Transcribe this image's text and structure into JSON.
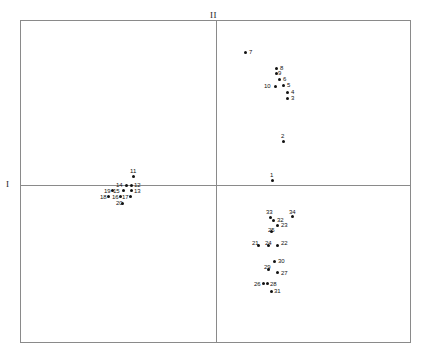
{
  "figure": {
    "type": "scatter",
    "background": "#ffffff",
    "frame_color": "#8a8a8a",
    "point_color": "#111111"
  },
  "axes": {
    "vertical_label": "II",
    "horizontal_label": "I"
  },
  "chart_data": {
    "type": "scatter",
    "title": "",
    "xlabel": "I",
    "ylabel": "II",
    "grid": false,
    "legend": null,
    "axis_style": "crossed-axes-at-origin",
    "origin_px": {
      "x": 216,
      "y": 185
    },
    "frame_px": {
      "left": 20,
      "top": 20,
      "right": 411,
      "bottom": 343
    },
    "note": "Principal coordinate / correspondence analysis style plot; 34 labelled observations.",
    "points": [
      {
        "label": "1",
        "x": 272,
        "y": 180,
        "lx": 270,
        "ly": 172,
        "lpos": "above"
      },
      {
        "label": "2",
        "x": 283,
        "y": 141,
        "lx": 281,
        "ly": 133,
        "lpos": "above"
      },
      {
        "label": "3",
        "x": 287,
        "y": 98,
        "lx": 291,
        "ly": 95,
        "lpos": "right"
      },
      {
        "label": "4",
        "x": 287,
        "y": 92,
        "lx": 291,
        "ly": 89,
        "lpos": "right"
      },
      {
        "label": "5",
        "x": 283,
        "y": 85,
        "lx": 287,
        "ly": 82,
        "lpos": "right"
      },
      {
        "label": "6",
        "x": 279,
        "y": 79,
        "lx": 283,
        "ly": 76,
        "lpos": "right"
      },
      {
        "label": "7",
        "x": 245,
        "y": 52,
        "lx": 249,
        "ly": 49,
        "lpos": "right"
      },
      {
        "label": "8",
        "x": 276,
        "y": 68,
        "lx": 280,
        "ly": 65,
        "lpos": "right"
      },
      {
        "label": "9",
        "x": 276,
        "y": 73,
        "lx": 278,
        "ly": 70,
        "lpos": "right"
      },
      {
        "label": "10",
        "x": 275,
        "y": 86,
        "lx": 264,
        "ly": 83,
        "lpos": "left"
      },
      {
        "label": "11",
        "x": 133,
        "y": 176,
        "lx": 130,
        "ly": 168,
        "lpos": "above"
      },
      {
        "label": "12",
        "x": 131,
        "y": 185,
        "lx": 134,
        "ly": 182,
        "lpos": "right"
      },
      {
        "label": "13",
        "x": 131,
        "y": 190,
        "lx": 134,
        "ly": 188,
        "lpos": "right"
      },
      {
        "label": "14",
        "x": 126,
        "y": 185,
        "lx": 116,
        "ly": 182,
        "lpos": "left"
      },
      {
        "label": "15",
        "x": 123,
        "y": 190,
        "lx": 113,
        "ly": 188,
        "lpos": "left"
      },
      {
        "label": "16",
        "x": 120,
        "y": 196,
        "lx": 112,
        "ly": 194,
        "lpos": "left"
      },
      {
        "label": "17",
        "x": 130,
        "y": 196,
        "lx": 122,
        "ly": 194,
        "lpos": "left"
      },
      {
        "label": "18",
        "x": 108,
        "y": 196,
        "lx": 100,
        "ly": 194,
        "lpos": "left"
      },
      {
        "label": "19",
        "x": 112,
        "y": 190,
        "lx": 104,
        "ly": 188,
        "lpos": "left"
      },
      {
        "label": "20",
        "x": 122,
        "y": 203,
        "lx": 116,
        "ly": 200,
        "lpos": "below"
      },
      {
        "label": "21",
        "x": 258,
        "y": 245,
        "lx": 252,
        "ly": 240,
        "lpos": "above-left"
      },
      {
        "label": "22",
        "x": 277,
        "y": 245,
        "lx": 281,
        "ly": 240,
        "lpos": "above-right"
      },
      {
        "label": "23",
        "x": 277,
        "y": 225,
        "lx": 281,
        "ly": 222,
        "lpos": "right"
      },
      {
        "label": "24",
        "x": 268,
        "y": 245,
        "lx": 265,
        "ly": 240,
        "lpos": "above"
      },
      {
        "label": "25",
        "x": 271,
        "y": 231,
        "lx": 268,
        "ly": 227,
        "lpos": "above"
      },
      {
        "label": "26",
        "x": 263,
        "y": 283,
        "lx": 254,
        "ly": 281,
        "lpos": "left"
      },
      {
        "label": "27",
        "x": 277,
        "y": 272,
        "lx": 281,
        "ly": 270,
        "lpos": "right"
      },
      {
        "label": "28",
        "x": 267,
        "y": 283,
        "lx": 270,
        "ly": 281,
        "lpos": "right"
      },
      {
        "label": "29",
        "x": 268,
        "y": 269,
        "lx": 264,
        "ly": 264,
        "lpos": "above"
      },
      {
        "label": "30",
        "x": 274,
        "y": 261,
        "lx": 278,
        "ly": 258,
        "lpos": "right"
      },
      {
        "label": "31",
        "x": 271,
        "y": 291,
        "lx": 274,
        "ly": 288,
        "lpos": "right"
      },
      {
        "label": "32",
        "x": 273,
        "y": 220,
        "lx": 277,
        "ly": 217,
        "lpos": "right"
      },
      {
        "label": "33",
        "x": 270,
        "y": 217,
        "lx": 266,
        "ly": 209,
        "lpos": "above"
      },
      {
        "label": "34",
        "x": 292,
        "y": 216,
        "lx": 289,
        "ly": 209,
        "lpos": "above"
      }
    ]
  }
}
